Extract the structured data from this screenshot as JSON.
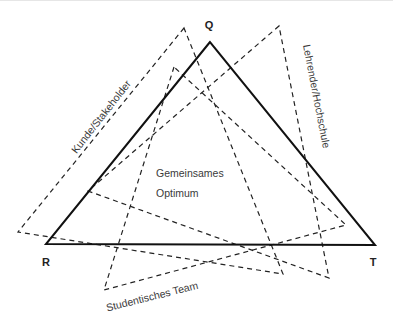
{
  "diagram": {
    "type": "overlapping-triangles",
    "main_triangle": {
      "style": "solid",
      "color": "#111111",
      "vertices": {
        "Q": {
          "label": "Q",
          "x": 210,
          "y": 42
        },
        "R": {
          "label": "R",
          "x": 46,
          "y": 244
        },
        "T": {
          "label": "T",
          "x": 375,
          "y": 245
        }
      }
    },
    "stakeholder_triangles": [
      {
        "label": "Kunde/Stakeholder",
        "style": "dashed",
        "points": [
          [
            184,
            28
          ],
          [
            18,
            232
          ],
          [
            283,
            274
          ]
        ]
      },
      {
        "label": "Lehrender/Hochschule",
        "style": "dashed",
        "points": [
          [
            279,
            26
          ],
          [
            88,
            191
          ],
          [
            329,
            278
          ]
        ]
      },
      {
        "label": "Studentisches Team",
        "style": "dashed",
        "points": [
          [
            174,
            67
          ],
          [
            104,
            290
          ],
          [
            346,
            225
          ]
        ]
      }
    ],
    "center_label": {
      "line1": "Gemeinsames",
      "line2": "Optimum"
    }
  }
}
